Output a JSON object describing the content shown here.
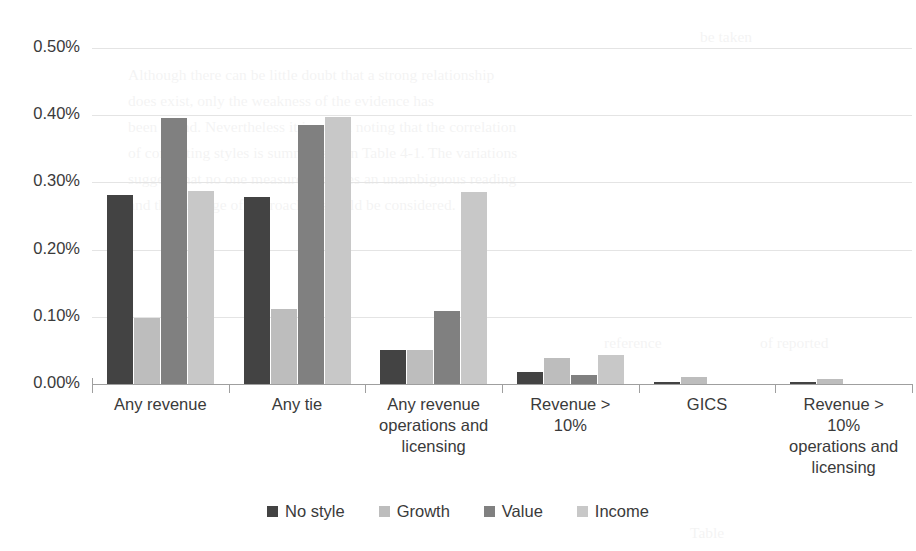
{
  "chart_data": {
    "type": "bar",
    "title": "",
    "subtitle": "",
    "xlabel": "",
    "ylabel": "",
    "ylim": [
      0,
      0.005
    ],
    "yticks": [
      "0.00%",
      "0.10%",
      "0.20%",
      "0.30%",
      "0.40%",
      "0.50%"
    ],
    "ytick_values": [
      0.0,
      0.001,
      0.002,
      0.003,
      0.004,
      0.005
    ],
    "grid": true,
    "legend_position": "bottom",
    "categories": [
      "Any revenue",
      "Any tie",
      "Any revenue operations and licensing",
      "Revenue > 10%",
      "GICS",
      "Revenue > 10% operations and licensing"
    ],
    "category_lines": [
      [
        "Any revenue"
      ],
      [
        "Any tie"
      ],
      [
        "Any revenue",
        "operations and",
        "licensing"
      ],
      [
        "Revenue >",
        "10%"
      ],
      [
        "GICS"
      ],
      [
        "Revenue >",
        "10%",
        "operations and",
        "licensing"
      ]
    ],
    "series": [
      {
        "name": "No style",
        "color": "#434343",
        "values": [
          0.00281,
          0.00278,
          0.00051,
          0.00018,
          3e-05,
          3e-05
        ]
      },
      {
        "name": "Growth",
        "color": "#bdbdbd",
        "values": [
          0.00098,
          0.00112,
          0.0005,
          0.00038,
          0.0001,
          8e-05
        ]
      },
      {
        "name": "Value",
        "color": "#808080",
        "values": [
          0.00396,
          0.00385,
          0.00108,
          0.00013,
          0.0,
          0.0
        ]
      },
      {
        "name": "Income",
        "color": "#c8c8c8",
        "values": [
          0.00287,
          0.00397,
          0.00286,
          0.00043,
          0.0,
          0.0
        ]
      }
    ]
  },
  "legend": {
    "items": [
      {
        "label": "No style",
        "color": "#434343"
      },
      {
        "label": "Growth",
        "color": "#bdbdbd"
      },
      {
        "label": "Value",
        "color": "#808080"
      },
      {
        "label": "Income",
        "color": "#c8c8c8"
      }
    ]
  },
  "background_ghost_text": [
    "be taken",
    "Although there can be little doubt that a strong relationship",
    "does exist, only the weakness of the evidence has",
    "been found. Nevertheless it is worth noting that the correlation",
    "of competing styles is summarised in Table 4-1. The variations",
    "suggest that no one measure provides an unambiguous reading",
    "and that a range of approaches should be considered.",
    "reference",
    "of reported",
    "Table"
  ]
}
